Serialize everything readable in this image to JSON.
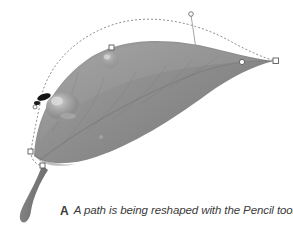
{
  "figure": {
    "caption_label": "A",
    "caption_text": "A path is being reshaped with the Pencil tool.",
    "colors": {
      "background": "#ffffff",
      "leaf_dark": "#7d7d7d",
      "leaf_mid": "#8d8d8d",
      "leaf_light": "#a8a8a8",
      "leaf_highlight": "#c4c4c4",
      "stem": "#7a7a7a",
      "path_stroke": "#8f8f8f",
      "anchor_stroke": "#5a5a5a",
      "anchor_fill": "#ffffff",
      "pencil_mark": "#111111",
      "caption_text": "#3a3a3a"
    }
  },
  "path_overlay": {
    "name": "vector-path-being-reshaped",
    "dash_pattern": "2 2",
    "anchors": [
      {
        "id": "anchor-left-base",
        "type": "square",
        "x": 31,
        "y": 152
      },
      {
        "id": "anchor-stem-joint",
        "type": "square",
        "x": 43,
        "y": 166
      },
      {
        "id": "anchor-top-left-mid",
        "type": "square",
        "x": 112,
        "y": 48
      },
      {
        "id": "anchor-right-inner",
        "type": "round",
        "x": 242,
        "y": 62
      },
      {
        "id": "anchor-right-tip",
        "type": "square",
        "x": 276,
        "y": 61
      }
    ],
    "handles": [
      {
        "id": "handle-upper-right",
        "from_x": 196,
        "from_y": 49,
        "to_x": 191,
        "to_y": 15,
        "endpoint": "round"
      },
      {
        "id": "handle-left-upper",
        "from_x": 44,
        "from_y": 96,
        "to_x": 38,
        "to_y": 106,
        "endpoint": "round"
      }
    ],
    "droplets": [
      {
        "id": "droplet-upper",
        "cx": 110,
        "cy": 60,
        "rx": 9,
        "ry": 8
      },
      {
        "id": "droplet-lower-large",
        "cx": 63,
        "cy": 107,
        "rx": 17,
        "ry": 14
      },
      {
        "id": "droplet-small",
        "cx": 101,
        "cy": 137,
        "rx": 2,
        "ry": 2
      }
    ],
    "pencil_mark": {
      "id": "pencil-stroke-mark",
      "x": 39,
      "y": 96
    }
  }
}
